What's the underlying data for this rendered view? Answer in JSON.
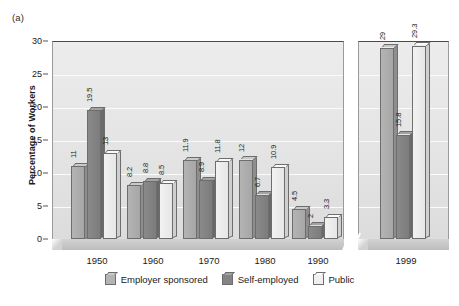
{
  "panel_label": "(a)",
  "chart_data": {
    "type": "bar",
    "title": "",
    "xlabel": "",
    "ylabel": "Percentage of Workers",
    "ylim": [
      0,
      30
    ],
    "yticks": [
      0,
      5,
      10,
      15,
      20,
      25,
      30
    ],
    "ytick_labels": [
      "0",
      "5",
      "10",
      "15",
      "20",
      "25",
      "30"
    ],
    "grid": true,
    "legend_position": "bottom",
    "axis_break": true,
    "categories": [
      "1950",
      "1960",
      "1970",
      "1980",
      "1990",
      "1999"
    ],
    "series": [
      {
        "name": "Employer sponsored",
        "color": "#b4b4b4",
        "values": [
          11,
          8.2,
          11.9,
          12,
          4.5,
          29
        ],
        "labels": [
          "11",
          "8.2",
          "11.9",
          "12",
          "4.5",
          "29"
        ]
      },
      {
        "name": "Self-employed",
        "color": "#848484",
        "values": [
          19.5,
          8.8,
          8.9,
          6.7,
          2,
          15.8
        ],
        "labels": [
          "19.5",
          "8.8",
          "8.9",
          "6.7",
          "2",
          "15.8"
        ]
      },
      {
        "name": "Public",
        "color": "#f0f0f0",
        "values": [
          13,
          8.5,
          11.8,
          10.9,
          3.3,
          29.3
        ],
        "labels": [
          "13",
          "8.5",
          "11.8",
          "10.9",
          "3.3",
          "29.3"
        ]
      }
    ]
  }
}
